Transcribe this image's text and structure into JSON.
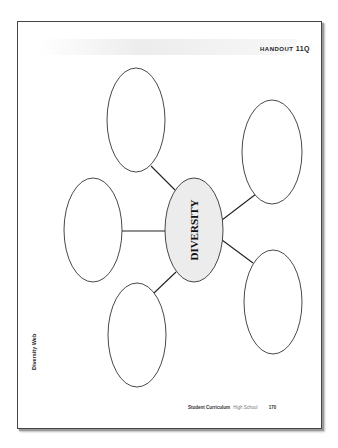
{
  "document": {
    "handout_label": "HANDOUT",
    "handout_number": "11Q",
    "side_title": "Diversity Web",
    "center_label": "DIVERSITY",
    "footer": {
      "curriculum": "Student Curriculum",
      "level": "High School",
      "page_number": "170"
    }
  },
  "diagram": {
    "type": "web",
    "center": {
      "label": "DIVERSITY",
      "fill": "#ececec"
    },
    "outer_nodes": [
      {
        "position": "top",
        "label": ""
      },
      {
        "position": "top-right",
        "label": ""
      },
      {
        "position": "left",
        "label": ""
      },
      {
        "position": "bottom-left",
        "label": ""
      },
      {
        "position": "bottom-right",
        "label": ""
      }
    ]
  }
}
